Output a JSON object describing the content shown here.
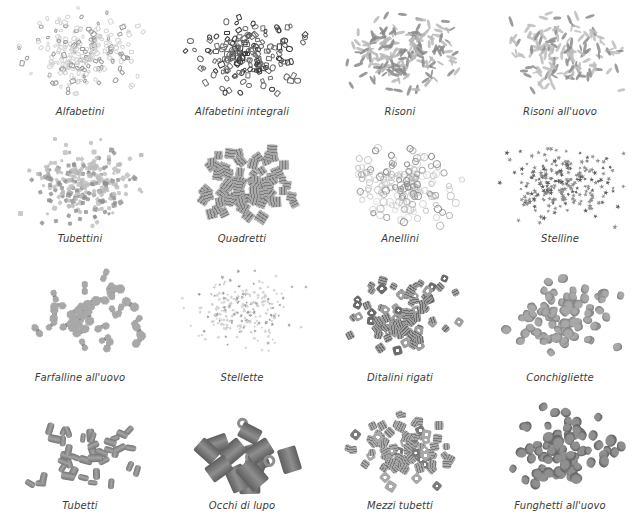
{
  "page": {
    "background": "#ffffff",
    "caption_color": "#3a3a3a"
  },
  "items": [
    {
      "label": "Alfabetini",
      "shape": "letters",
      "tone": "#d4d4d4",
      "shade": "#9a9a9a",
      "count": 230,
      "size": 5
    },
    {
      "label": "Alfabetini integrali",
      "shape": "letters",
      "tone": "#6a6a6a",
      "shade": "#3a3a3a",
      "count": 170,
      "size": 6
    },
    {
      "label": "Risoni",
      "shape": "grain",
      "tone": "#b8b8b8",
      "shade": "#8a8a8a",
      "count": 190,
      "size": 9
    },
    {
      "label": "Risoni all'uovo",
      "shape": "grain",
      "tone": "#bdbdbd",
      "shade": "#8c8c8c",
      "count": 150,
      "size": 9
    },
    {
      "label": "Tubettini",
      "shape": "tiny",
      "tone": "#bcbcbc",
      "shade": "#8f8f8f",
      "count": 260,
      "size": 4
    },
    {
      "label": "Quadretti",
      "shape": "square",
      "tone": "#a9a9a9",
      "shade": "#7a7a7a",
      "count": 80,
      "size": 9
    },
    {
      "label": "Anellini",
      "shape": "ring",
      "tone": "#c8c8c8",
      "shade": "#8e8e8e",
      "count": 170,
      "size": 7
    },
    {
      "label": "Stelline",
      "shape": "star",
      "tone": "#8f8f8f",
      "shade": "#5f5f5f",
      "count": 230,
      "size": 5
    },
    {
      "label": "Farfalline all'uovo",
      "shape": "bow",
      "tone": "#a8a8a8",
      "shade": "#7b7b7b",
      "count": 38,
      "size": 16
    },
    {
      "label": "Stellette",
      "shape": "star",
      "tone": "#cfcfcf",
      "shade": "#9e9e9e",
      "count": 220,
      "size": 4
    },
    {
      "label": "Ditalini rigati",
      "shape": "tube",
      "tone": "#9f9f9f",
      "shade": "#6b6b6b",
      "count": 95,
      "size": 8
    },
    {
      "label": "Conchigliette",
      "shape": "shell",
      "tone": "#a8a8a8",
      "shade": "#7c7c7c",
      "count": 85,
      "size": 9
    },
    {
      "label": "Tubetti",
      "shape": "cylinder",
      "tone": "#a3a3a3",
      "shade": "#767676",
      "count": 42,
      "size": 12
    },
    {
      "label": "Occhi di lupo",
      "shape": "bigtube",
      "tone": "#8e8e8e",
      "shade": "#5e5e5e",
      "count": 16,
      "size": 24
    },
    {
      "label": "Mezzi tubetti",
      "shape": "tube",
      "tone": "#a9a9a9",
      "shade": "#7a7a7a",
      "count": 90,
      "size": 8
    },
    {
      "label": "Funghetti all'uovo",
      "shape": "shell",
      "tone": "#8f8f8f",
      "shade": "#5a5a5a",
      "count": 75,
      "size": 10
    }
  ]
}
